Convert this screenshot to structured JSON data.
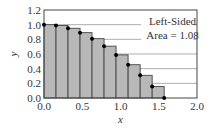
{
  "chart_data": {
    "type": "bar",
    "title": "",
    "xlabel": "x",
    "ylabel": "y",
    "xlim": [
      0.0,
      2.0
    ],
    "ylim": [
      0.0,
      1.2
    ],
    "xticks": [
      "0.0",
      "0.5",
      "1.0",
      "1.5",
      "2.0"
    ],
    "yticks": [
      "0.0",
      "0.2",
      "0.4",
      "0.6",
      "0.8",
      "1.0",
      "1.2"
    ],
    "grid": "horizontal",
    "bar_left_edges": [
      0.0,
      0.157,
      0.314,
      0.471,
      0.628,
      0.785,
      0.942,
      1.1,
      1.257,
      1.414
    ],
    "bar_width": 0.157,
    "values": [
      1.0,
      0.988,
      0.951,
      0.891,
      0.809,
      0.707,
      0.588,
      0.454,
      0.309,
      0.156
    ],
    "points": {
      "x": [
        0.0,
        0.157,
        0.314,
        0.471,
        0.628,
        0.785,
        0.942,
        1.1,
        1.257,
        1.414,
        1.571
      ],
      "y": [
        1.0,
        0.988,
        0.951,
        0.891,
        0.809,
        0.707,
        0.588,
        0.454,
        0.309,
        0.156,
        0.0
      ]
    },
    "annotation": [
      "Left-Sided",
      "Area = 1.08"
    ],
    "colors": {
      "bars": "#b8b8b8",
      "bar_edge": "#444444",
      "grid": "#999999",
      "points": "#000000"
    }
  },
  "annotation": {
    "line1": "Left-Sided",
    "line2": "Area = 1.08"
  },
  "axes": {
    "xlabel": "x",
    "ylabel": "y"
  }
}
